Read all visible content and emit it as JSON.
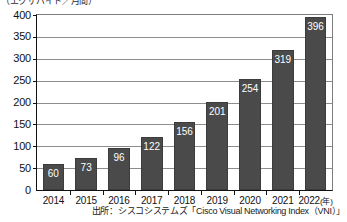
{
  "unit_caption": "（エクサバイト／月間）",
  "source_note": "出所：シスコシステムズ「Cisco Visual Networking Index（VNI）」",
  "year_axis_suffix": "(年)",
  "chart_data": {
    "type": "bar",
    "title": "",
    "subtitle": "",
    "xlabel": "(年)",
    "ylabel": "（エクサバイト／月間）",
    "categories": [
      "2014",
      "2015",
      "2016",
      "2017",
      "2018",
      "2019",
      "2020",
      "2021",
      "2022"
    ],
    "values": [
      60,
      73,
      96,
      122,
      156,
      201,
      254,
      319,
      396
    ],
    "data_labels": [
      "60",
      "73",
      "96",
      "122",
      "156",
      "201",
      "254",
      "319",
      "396"
    ],
    "ylim": [
      0,
      400
    ],
    "yticks": [
      0,
      50,
      100,
      150,
      200,
      250,
      300,
      350,
      400
    ],
    "ytick_labels": [
      "0",
      "50",
      "100",
      "150",
      "200",
      "250",
      "300",
      "350",
      "400"
    ],
    "grid": true,
    "grid_axis": "y",
    "legend": false,
    "legend_position": "none",
    "bar_color": "#4a4a4a",
    "bar_label_color": "#ffffff",
    "gridline_color": "#8d8d8d",
    "axis_color": "#111111",
    "background_color": "#ffffff"
  }
}
